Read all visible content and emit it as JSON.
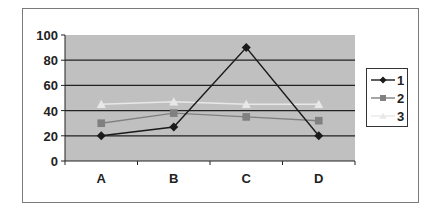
{
  "chart_data": {
    "type": "line",
    "title": "",
    "xlabel": "",
    "ylabel": "",
    "categories": [
      "A",
      "B",
      "C",
      "D"
    ],
    "series": [
      {
        "name": "1",
        "marker": "diamond",
        "color": "#1a1a1a",
        "values": [
          20,
          27,
          90,
          20
        ]
      },
      {
        "name": "2",
        "marker": "square",
        "color": "#808080",
        "values": [
          30,
          38,
          35,
          32
        ]
      },
      {
        "name": "3",
        "marker": "triangle",
        "color": "#e8e8e8",
        "values": [
          45,
          47,
          45,
          45
        ]
      }
    ],
    "ylim": [
      0,
      100
    ],
    "yticks": [
      0,
      20,
      40,
      60,
      80,
      100
    ],
    "grid": true,
    "plot_background": "#c0c0c0",
    "legend_position": "right"
  }
}
